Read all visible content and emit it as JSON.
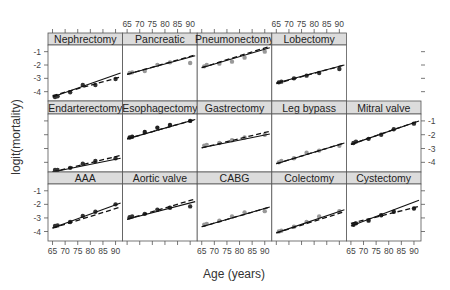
{
  "chart_data": {
    "type": "line",
    "layout": "lattice 5x3 panels with strip labels",
    "xlabel": "Age (years)",
    "ylabel": "logit(mortality)",
    "xticks": [
      65,
      70,
      75,
      80,
      85,
      90
    ],
    "yticks": [
      -1,
      -2,
      -3,
      -4
    ],
    "xlim": [
      64,
      92
    ],
    "ylim": [
      -4.7,
      -0.5
    ],
    "grid": false,
    "legend": "none",
    "line_styles": {
      "fit_solid": "solid line (model fit)",
      "fit_dashed": "dashed line (alternative fit)"
    },
    "x_points": [
      66,
      67,
      72,
      77,
      82,
      90
    ],
    "panels": [
      {
        "name": "Nephrectomy",
        "row": 0,
        "col": 0,
        "point_color": "#333333",
        "points": [
          -4.4,
          -4.35,
          -4.05,
          -3.5,
          -3.5,
          -3.05
        ],
        "solid": [
          [
            65,
            -4.4
          ],
          [
            92,
            -2.6
          ]
        ],
        "dashed": [
          [
            65,
            -4.3
          ],
          [
            92,
            -2.9
          ]
        ]
      },
      {
        "name": "Pancreatic",
        "row": 0,
        "col": 1,
        "point_color": "#999999",
        "points": [
          -2.6,
          -2.55,
          -2.45,
          -2.0,
          -1.8,
          -1.85
        ],
        "solid": [
          [
            65,
            -2.7
          ],
          [
            92,
            -1.3
          ]
        ],
        "dashed": [
          [
            65,
            -2.7
          ],
          [
            92,
            -1.25
          ]
        ]
      },
      {
        "name": "Pneumonectomy",
        "row": 0,
        "col": 2,
        "point_color": "#999999",
        "points": [
          -2.1,
          -2.0,
          -1.9,
          -1.75,
          -1.45,
          -1.0
        ],
        "solid": [
          [
            65,
            -2.2
          ],
          [
            92,
            -0.7
          ]
        ],
        "dashed": [
          [
            65,
            -2.2
          ],
          [
            92,
            -0.6
          ]
        ]
      },
      {
        "name": "Lobectomy",
        "row": 0,
        "col": 3,
        "point_color": "#333333",
        "points": [
          -3.3,
          -3.25,
          -3.0,
          -2.8,
          -2.6,
          -2.3
        ],
        "solid": [
          [
            65,
            -3.35
          ],
          [
            92,
            -2.0
          ]
        ],
        "dashed": [
          [
            65,
            -3.4
          ],
          [
            92,
            -2.0
          ]
        ]
      },
      {
        "name": "Endarterectomy",
        "row": 1,
        "col": 0,
        "point_color": "#333333",
        "points": [
          -4.55,
          -4.55,
          -4.4,
          -4.1,
          -3.9,
          -3.7
        ],
        "solid": [
          [
            65,
            -4.7
          ],
          [
            92,
            -3.7
          ]
        ],
        "dashed": [
          [
            65,
            -4.7
          ],
          [
            92,
            -3.5
          ]
        ]
      },
      {
        "name": "Esophagectomy",
        "row": 1,
        "col": 1,
        "point_color": "#222222",
        "points": [
          -2.2,
          -2.15,
          -1.8,
          -1.5,
          -1.3,
          -1.0
        ],
        "solid": [
          [
            65,
            -2.3
          ],
          [
            92,
            -0.9
          ]
        ],
        "dashed": [
          [
            65,
            -2.3
          ],
          [
            92,
            -0.9
          ]
        ]
      },
      {
        "name": "Gastrectomy",
        "row": 1,
        "col": 2,
        "point_color": "#999999",
        "points": [
          -2.8,
          -2.75,
          -2.6,
          -2.4,
          -2.2,
          -2.0
        ],
        "solid": [
          [
            65,
            -2.95
          ],
          [
            92,
            -1.95
          ]
        ],
        "dashed": [
          [
            65,
            -2.95
          ],
          [
            92,
            -1.75
          ]
        ]
      },
      {
        "name": "Leg bypass",
        "row": 1,
        "col": 3,
        "point_color": "#999999",
        "points": [
          -4.0,
          -3.9,
          -3.7,
          -3.3,
          -3.15,
          -2.8
        ],
        "solid": [
          [
            65,
            -4.1
          ],
          [
            92,
            -2.6
          ]
        ],
        "dashed": [
          [
            65,
            -4.1
          ],
          [
            92,
            -2.6
          ]
        ]
      },
      {
        "name": "Mitral valve",
        "row": 1,
        "col": 4,
        "point_color": "#333333",
        "points": [
          -2.6,
          -2.5,
          -2.3,
          -2.0,
          -1.6,
          -1.2
        ],
        "solid": [
          [
            65,
            -2.7
          ],
          [
            92,
            -1.0
          ]
        ],
        "dashed": [
          [
            65,
            -2.7
          ],
          [
            92,
            -1.0
          ]
        ]
      },
      {
        "name": "AAA",
        "row": 2,
        "col": 0,
        "point_color": "#333333",
        "points": [
          -3.6,
          -3.55,
          -3.3,
          -2.85,
          -2.55,
          -2.0
        ],
        "solid": [
          [
            65,
            -3.75
          ],
          [
            92,
            -1.9
          ]
        ],
        "dashed": [
          [
            65,
            -3.75
          ],
          [
            92,
            -2.2
          ]
        ]
      },
      {
        "name": "Aortic valve",
        "row": 2,
        "col": 1,
        "point_color": "#333333",
        "points": [
          -2.95,
          -2.9,
          -2.7,
          -2.4,
          -2.25,
          -2.15
        ],
        "solid": [
          [
            65,
            -3.1
          ],
          [
            92,
            -1.8
          ]
        ],
        "dashed": [
          [
            65,
            -3.1
          ],
          [
            92,
            -1.6
          ]
        ]
      },
      {
        "name": "CABG",
        "row": 2,
        "col": 2,
        "point_color": "#999999",
        "points": [
          -3.5,
          -3.45,
          -3.2,
          -2.9,
          -2.6,
          -2.5
        ],
        "solid": [
          [
            65,
            -3.65
          ],
          [
            92,
            -2.2
          ]
        ],
        "dashed": [
          [
            65,
            -3.65
          ],
          [
            92,
            -2.2
          ]
        ]
      },
      {
        "name": "Colectomy",
        "row": 2,
        "col": 3,
        "point_color": "#999999",
        "points": [
          -4.0,
          -3.95,
          -3.65,
          -3.3,
          -2.9,
          -2.5
        ],
        "solid": [
          [
            65,
            -4.1
          ],
          [
            92,
            -2.4
          ]
        ],
        "dashed": [
          [
            65,
            -4.1
          ],
          [
            92,
            -2.55
          ]
        ]
      },
      {
        "name": "Cystectomy",
        "row": 2,
        "col": 4,
        "point_color": "#222222",
        "points": [
          -3.5,
          -3.4,
          -3.2,
          -2.8,
          -2.55,
          -2.3
        ],
        "solid": [
          [
            65,
            -3.6
          ],
          [
            92,
            -1.7
          ]
        ],
        "dashed": [
          [
            65,
            -3.4
          ],
          [
            92,
            -2.15
          ]
        ]
      }
    ]
  },
  "colors": {
    "strip_bg": "#dcdcdc",
    "panel_border": "#555555",
    "line": "#111111",
    "tick": "#555555"
  }
}
